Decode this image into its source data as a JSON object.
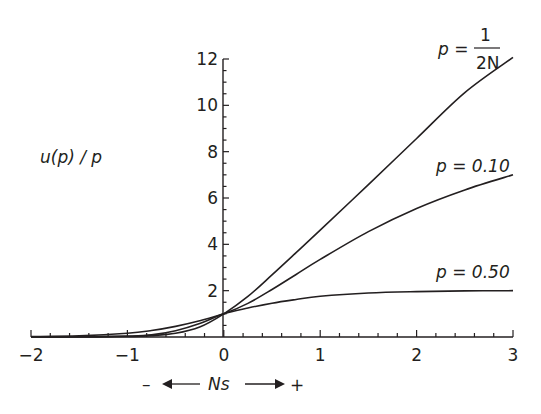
{
  "chart_data": {
    "type": "line",
    "title": "",
    "xlabel": "Ns",
    "ylabel": "u(p) / p",
    "xlim": [
      -2,
      3
    ],
    "ylim": [
      0,
      12
    ],
    "grid": false,
    "legend_position": "inline labels at right end of curves",
    "x_ticks": [
      -2,
      -1,
      0,
      1,
      2,
      3
    ],
    "y_ticks": [
      2,
      4,
      6,
      8,
      10,
      12
    ],
    "x_direction_annotation": {
      "left": "–",
      "center": "Ns",
      "right": "+"
    },
    "x": [
      -2,
      -1.5,
      -1,
      -0.75,
      -0.5,
      -0.25,
      0,
      0.25,
      0.5,
      0.75,
      1,
      1.5,
      2,
      2.5,
      3
    ],
    "series": [
      {
        "name": "p = 1/2N",
        "label_main": "p =",
        "label_num": "1",
        "label_den": "2N",
        "values": [
          0.0,
          0.0,
          0.02,
          0.06,
          0.16,
          0.43,
          1.0,
          1.75,
          2.68,
          3.64,
          4.61,
          6.58,
          8.57,
          10.55,
          12.07
        ]
      },
      {
        "name": "p = 0.10",
        "label": "p = 0.10",
        "values": [
          0.02,
          0.05,
          0.16,
          0.28,
          0.46,
          0.7,
          1.0,
          1.45,
          2.05,
          2.7,
          3.35,
          4.55,
          5.55,
          6.35,
          7.0
        ]
      },
      {
        "name": "p = 0.50",
        "label": "p = 0.50",
        "values": [
          0.0,
          0.01,
          0.04,
          0.09,
          0.27,
          0.58,
          1.0,
          1.25,
          1.46,
          1.62,
          1.76,
          1.9,
          1.96,
          1.99,
          2.0
        ]
      }
    ]
  }
}
